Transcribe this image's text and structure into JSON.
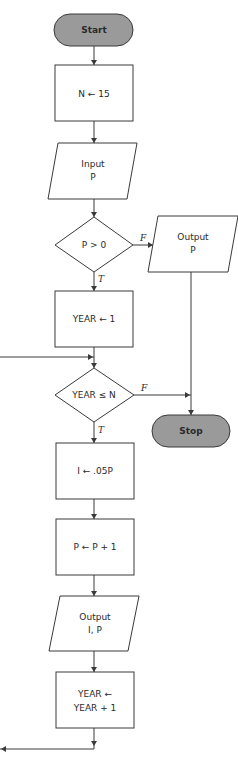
{
  "diagram": {
    "type": "flowchart",
    "colors": {
      "terminal_fill": "#9a9a9a",
      "stroke": "#3a3a3a",
      "background": "#ffffff"
    },
    "nodes": [
      {
        "id": "start",
        "kind": "terminal",
        "label": "Start"
      },
      {
        "id": "set_n",
        "kind": "process",
        "label": "N ← 15"
      },
      {
        "id": "input_p",
        "kind": "io",
        "line1": "Input",
        "line2": "P"
      },
      {
        "id": "test_p",
        "kind": "decision",
        "label": "P > 0"
      },
      {
        "id": "output_p",
        "kind": "io",
        "line1": "Output",
        "line2": "P"
      },
      {
        "id": "set_year",
        "kind": "process",
        "label": "YEAR ← 1"
      },
      {
        "id": "test_year",
        "kind": "decision",
        "label": "YEAR ≤ N"
      },
      {
        "id": "stop",
        "kind": "terminal",
        "label": "Stop"
      },
      {
        "id": "calc_i",
        "kind": "process",
        "label": "I ← .05P"
      },
      {
        "id": "update_p",
        "kind": "process",
        "label": "P ← P + 1"
      },
      {
        "id": "output_ip",
        "kind": "io",
        "line1": "Output",
        "line2": "I, P"
      },
      {
        "id": "inc_year",
        "kind": "process",
        "line1": "YEAR ←",
        "line2": "YEAR + 1"
      }
    ],
    "edges": [
      {
        "from": "start",
        "to": "set_n"
      },
      {
        "from": "set_n",
        "to": "input_p"
      },
      {
        "from": "input_p",
        "to": "test_p"
      },
      {
        "from": "test_p",
        "to": "output_p",
        "label": "F"
      },
      {
        "from": "test_p",
        "to": "set_year",
        "label": "T"
      },
      {
        "from": "set_year",
        "to": "test_year"
      },
      {
        "from": "test_year",
        "to": "stop",
        "label": "F"
      },
      {
        "from": "output_p",
        "to": "stop"
      },
      {
        "from": "test_year",
        "to": "calc_i",
        "label": "T"
      },
      {
        "from": "calc_i",
        "to": "update_p"
      },
      {
        "from": "update_p",
        "to": "output_ip"
      },
      {
        "from": "output_ip",
        "to": "inc_year"
      },
      {
        "from": "inc_year",
        "to": "test_year",
        "label": "loop back"
      }
    ],
    "flags": {
      "true": "T",
      "false": "F"
    }
  }
}
